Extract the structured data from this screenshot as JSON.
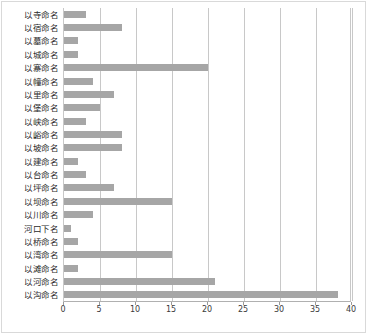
{
  "chart_data": {
    "type": "bar",
    "orientation": "horizontal",
    "title": "",
    "subtitle": "",
    "xlabel": "",
    "ylabel": "",
    "xlim": [
      0,
      40
    ],
    "ylim": null,
    "grid": true,
    "grid_axis": "x",
    "legend": false,
    "legend_position": "none",
    "bar_color": "#a6a6a6",
    "xticks": [
      0,
      5,
      10,
      15,
      20,
      25,
      30,
      35,
      40
    ],
    "xtick_labels": [
      "0",
      "5",
      "10",
      "15",
      "20",
      "25",
      "30",
      "35",
      "40"
    ],
    "categories": [
      "以寺命名",
      "以宿命名",
      "以墓命名",
      "以城命名",
      "以寨命名",
      "以幢命名",
      "以里命名",
      "以堡命名",
      "以峡命名",
      "以峪命名",
      "以坡命名",
      "以建命名",
      "以台命名",
      "以坪命名",
      "以坝命名",
      "以川命名",
      "河口下名",
      "以桥命名",
      "以湾命名",
      "以滩命名",
      "以河命名",
      "以沟命名"
    ],
    "values": [
      3,
      8,
      2,
      2,
      20,
      4,
      7,
      5,
      3,
      8,
      8,
      2,
      3,
      7,
      15,
      4,
      1,
      2,
      15,
      2,
      21,
      38
    ],
    "annotations": []
  },
  "figure": {
    "background_color": "#ffffff",
    "border_color": "#d9d9d9",
    "gridline_color": "#c8c8c8",
    "axis_color": "#b0b0b0",
    "tick_label_color": "#3a3a3a",
    "category_label_color": "#2b2b2b"
  }
}
